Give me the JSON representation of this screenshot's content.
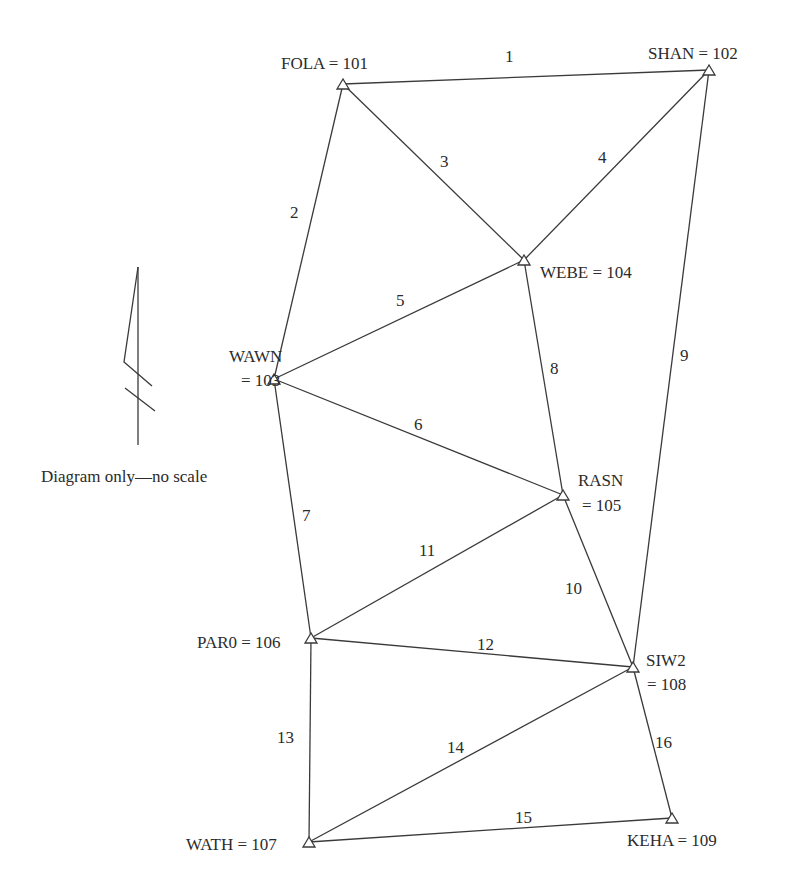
{
  "diagram": {
    "type": "survey-network",
    "caption": "Diagram only—no scale",
    "north_arrow": {
      "icon": "north-arrow-icon"
    },
    "stations": [
      {
        "id": "101",
        "name": "FOLA",
        "label": "FOLA = 101",
        "x": 343,
        "y": 84
      },
      {
        "id": "102",
        "name": "SHAN",
        "label": "SHAN = 102",
        "x": 709,
        "y": 70
      },
      {
        "id": "103",
        "name": "WAWN",
        "label_line1": "WAWN",
        "label_line2": "= 103",
        "x": 274,
        "y": 379
      },
      {
        "id": "104",
        "name": "WEBE",
        "label": "WEBE = 104",
        "x": 524,
        "y": 260
      },
      {
        "id": "105",
        "name": "RASN",
        "label_line1": "RASN",
        "label_line2": "= 105",
        "x": 563,
        "y": 495
      },
      {
        "id": "106",
        "name": "PAR0",
        "label": "PAR0 = 106",
        "x": 311,
        "y": 638
      },
      {
        "id": "107",
        "name": "WATH",
        "label": "WATH = 107",
        "x": 309,
        "y": 842
      },
      {
        "id": "108",
        "name": "SIW2",
        "label_line1": "SIW2",
        "label_line2": "= 108",
        "x": 633,
        "y": 667
      },
      {
        "id": "109",
        "name": "KEHA",
        "label": "KEHA = 109",
        "x": 672,
        "y": 818
      }
    ],
    "lines": [
      {
        "label": "1",
        "from": "101",
        "to": "102"
      },
      {
        "label": "2",
        "from": "101",
        "to": "103"
      },
      {
        "label": "3",
        "from": "101",
        "to": "104"
      },
      {
        "label": "4",
        "from": "102",
        "to": "104"
      },
      {
        "label": "5",
        "from": "103",
        "to": "104"
      },
      {
        "label": "6",
        "from": "103",
        "to": "105"
      },
      {
        "label": "7",
        "from": "103",
        "to": "106"
      },
      {
        "label": "8",
        "from": "104",
        "to": "105"
      },
      {
        "label": "9",
        "from": "102",
        "to": "108"
      },
      {
        "label": "10",
        "from": "105",
        "to": "108"
      },
      {
        "label": "11",
        "from": "106",
        "to": "105"
      },
      {
        "label": "12",
        "from": "106",
        "to": "108"
      },
      {
        "label": "13",
        "from": "106",
        "to": "107"
      },
      {
        "label": "14",
        "from": "107",
        "to": "108"
      },
      {
        "label": "15",
        "from": "107",
        "to": "109"
      },
      {
        "label": "16",
        "from": "108",
        "to": "109"
      }
    ]
  }
}
